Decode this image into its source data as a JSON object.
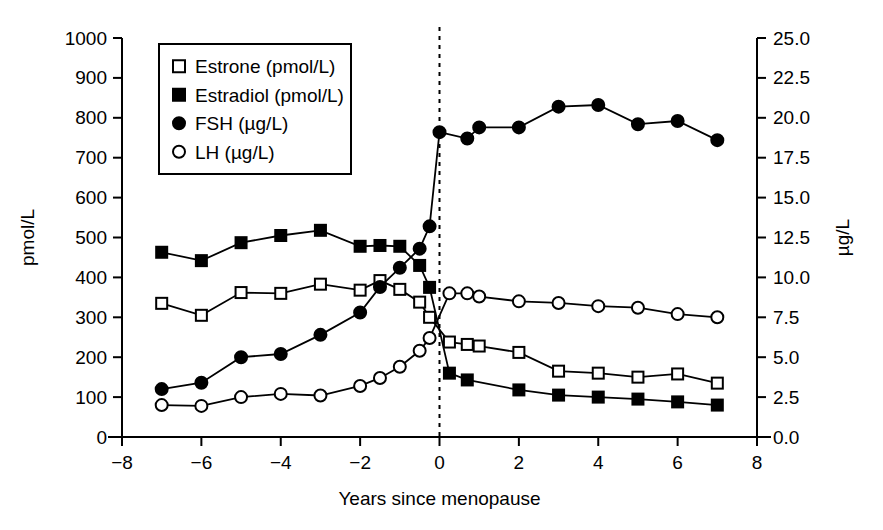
{
  "chart_data": {
    "type": "line",
    "title": "",
    "xlabel": "Years since menopause",
    "ylabel": "pmol/L",
    "y2label": "µg/L",
    "xlim": [
      -8,
      8
    ],
    "ylim": [
      0,
      1000
    ],
    "y2lim": [
      0.0,
      25.0
    ],
    "xticks": [
      -8,
      -6,
      -4,
      -2,
      0,
      2,
      4,
      6,
      8
    ],
    "xticklabels": [
      "−8",
      "−6",
      "−4",
      "−2",
      "0",
      "2",
      "4",
      "6",
      "8"
    ],
    "yticks": [
      0,
      100,
      200,
      300,
      400,
      500,
      600,
      700,
      800,
      900,
      1000
    ],
    "yticklabels": [
      "0",
      "100",
      "200",
      "300",
      "400",
      "500",
      "600",
      "700",
      "800",
      "900",
      "1000"
    ],
    "y2ticks": [
      0.0,
      2.5,
      5.0,
      7.5,
      10.0,
      12.5,
      15.0,
      17.5,
      20.0,
      22.5,
      25.0
    ],
    "y2ticklabels": [
      "0.0",
      "2.5",
      "5.0",
      "7.5",
      "10.0",
      "12.5",
      "15.0",
      "17.5",
      "20.0",
      "22.5",
      "25.0"
    ],
    "grid": false,
    "legend_position": "upper-left",
    "annotations": [
      {
        "name": "menopause-reference-line",
        "type": "vline",
        "x": 0,
        "style": "dashed"
      }
    ],
    "series": [
      {
        "name": "Estrone (pmol/L)",
        "axis": "left",
        "marker": "open-square",
        "points": [
          {
            "x": -7.0,
            "y": 335
          },
          {
            "x": -6.0,
            "y": 305
          },
          {
            "x": -5.0,
            "y": 362
          },
          {
            "x": -4.0,
            "y": 360
          },
          {
            "x": -3.0,
            "y": 383
          },
          {
            "x": -2.0,
            "y": 368
          },
          {
            "x": -1.5,
            "y": 392
          },
          {
            "x": -1.0,
            "y": 370
          },
          {
            "x": -0.5,
            "y": 338
          },
          {
            "x": -0.25,
            "y": 300
          },
          {
            "x": 0.25,
            "y": 238
          },
          {
            "x": 0.7,
            "y": 232
          },
          {
            "x": 1.0,
            "y": 228
          },
          {
            "x": 2.0,
            "y": 212
          },
          {
            "x": 3.0,
            "y": 165
          },
          {
            "x": 4.0,
            "y": 160
          },
          {
            "x": 5.0,
            "y": 150
          },
          {
            "x": 6.0,
            "y": 158
          },
          {
            "x": 7.0,
            "y": 135
          }
        ]
      },
      {
        "name": "Estradiol (pmol/L)",
        "axis": "left",
        "marker": "filled-square",
        "points": [
          {
            "x": -7.0,
            "y": 463
          },
          {
            "x": -6.0,
            "y": 442
          },
          {
            "x": -5.0,
            "y": 487
          },
          {
            "x": -4.0,
            "y": 505
          },
          {
            "x": -3.0,
            "y": 518
          },
          {
            "x": -2.0,
            "y": 478
          },
          {
            "x": -1.5,
            "y": 480
          },
          {
            "x": -1.0,
            "y": 478
          },
          {
            "x": -0.5,
            "y": 430
          },
          {
            "x": -0.25,
            "y": 375
          },
          {
            "x": 0.25,
            "y": 160
          },
          {
            "x": 0.7,
            "y": 143
          },
          {
            "x": 2.0,
            "y": 118
          },
          {
            "x": 3.0,
            "y": 105
          },
          {
            "x": 4.0,
            "y": 100
          },
          {
            "x": 5.0,
            "y": 95
          },
          {
            "x": 6.0,
            "y": 88
          },
          {
            "x": 7.0,
            "y": 80
          }
        ]
      },
      {
        "name": "FSH (µg/L)",
        "axis": "right",
        "marker": "filled-circle",
        "points": [
          {
            "x": -7.0,
            "y": 3.0
          },
          {
            "x": -6.0,
            "y": 3.4
          },
          {
            "x": -5.0,
            "y": 5.0
          },
          {
            "x": -4.0,
            "y": 5.2
          },
          {
            "x": -3.0,
            "y": 6.4
          },
          {
            "x": -2.0,
            "y": 7.8
          },
          {
            "x": -1.5,
            "y": 9.4
          },
          {
            "x": -1.0,
            "y": 10.6
          },
          {
            "x": -0.5,
            "y": 11.8
          },
          {
            "x": -0.25,
            "y": 13.2
          },
          {
            "x": 0.0,
            "y": 19.1
          },
          {
            "x": 0.7,
            "y": 18.7
          },
          {
            "x": 1.0,
            "y": 19.4
          },
          {
            "x": 2.0,
            "y": 19.4
          },
          {
            "x": 3.0,
            "y": 20.7
          },
          {
            "x": 4.0,
            "y": 20.8
          },
          {
            "x": 5.0,
            "y": 19.6
          },
          {
            "x": 6.0,
            "y": 19.8
          },
          {
            "x": 7.0,
            "y": 18.6
          }
        ]
      },
      {
        "name": "LH (µg/L)",
        "axis": "right",
        "marker": "open-circle",
        "points": [
          {
            "x": -7.0,
            "y": 2.0
          },
          {
            "x": -6.0,
            "y": 1.95
          },
          {
            "x": -5.0,
            "y": 2.5
          },
          {
            "x": -4.0,
            "y": 2.7
          },
          {
            "x": -3.0,
            "y": 2.6
          },
          {
            "x": -2.0,
            "y": 3.2
          },
          {
            "x": -1.5,
            "y": 3.7
          },
          {
            "x": -1.0,
            "y": 4.4
          },
          {
            "x": -0.5,
            "y": 5.4
          },
          {
            "x": -0.25,
            "y": 6.2
          },
          {
            "x": 0.25,
            "y": 9.0
          },
          {
            "x": 0.7,
            "y": 9.0
          },
          {
            "x": 1.0,
            "y": 8.8
          },
          {
            "x": 2.0,
            "y": 8.5
          },
          {
            "x": 3.0,
            "y": 8.4
          },
          {
            "x": 4.0,
            "y": 8.2
          },
          {
            "x": 5.0,
            "y": 8.1
          },
          {
            "x": 6.0,
            "y": 7.7
          },
          {
            "x": 7.0,
            "y": 7.5
          }
        ]
      }
    ]
  },
  "legend": {
    "items": [
      {
        "label": "Estrone (pmol/L)",
        "marker": "open-square"
      },
      {
        "label": "Estradiol (pmol/L)",
        "marker": "filled-square"
      },
      {
        "label": "FSH (µg/L)",
        "marker": "filled-circle"
      },
      {
        "label": "LH (µg/L)",
        "marker": "open-circle"
      }
    ]
  },
  "colors": {
    "ink": "#000000",
    "background": "#ffffff"
  }
}
